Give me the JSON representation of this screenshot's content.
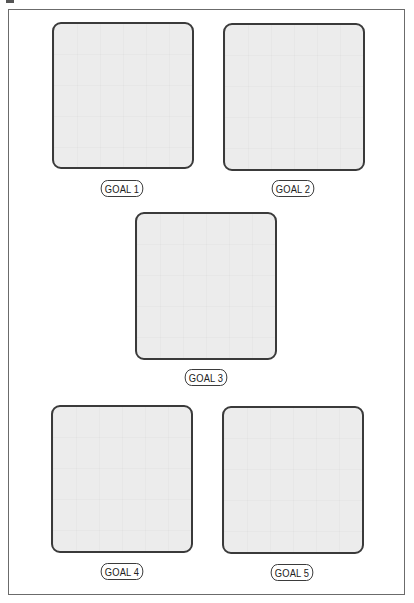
{
  "goals": [
    {
      "label": "GOAL 1"
    },
    {
      "label": "GOAL 2"
    },
    {
      "label": "GOAL 3"
    },
    {
      "label": "GOAL 4"
    },
    {
      "label": "GOAL 5"
    }
  ],
  "colors": {
    "box_fill": "#ececec",
    "box_border": "#3a3a3a",
    "frame_border": "#6b6b6b"
  }
}
